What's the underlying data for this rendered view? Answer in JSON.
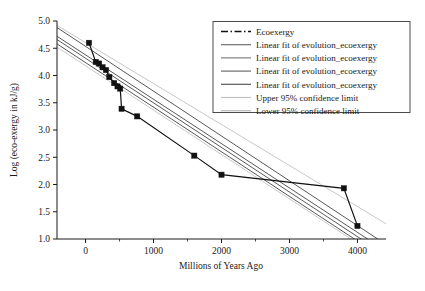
{
  "chart_data": {
    "type": "line",
    "title": "",
    "xlabel": "Millions of Years Ago",
    "ylabel": "Log (eco-exergy in kJ/g)",
    "xlim": [
      -420,
      4420
    ],
    "ylim": [
      1.0,
      5.0
    ],
    "grid": false,
    "legend_position": "top-right",
    "x_major_ticks": [
      0,
      1000,
      2000,
      3000,
      4000
    ],
    "x_tick_labels": [
      "0",
      "1000",
      "2000",
      "3000",
      "4000"
    ],
    "x_minor_ticks": [
      500,
      1500,
      2500,
      3500
    ],
    "y_major_ticks": [
      1.0,
      1.5,
      2.0,
      2.5,
      3.0,
      3.5,
      4.0,
      4.5,
      5.0
    ],
    "y_tick_labels": [
      "1.0",
      "1.5",
      "2.0",
      "2.5",
      "3.0",
      "3.5",
      "4.0",
      "4.5",
      "5.0"
    ],
    "series": [
      {
        "name": "Ecoexergy",
        "style": "dash-dot-marker",
        "color": "#111111",
        "x": [
          50,
          150,
          200,
          250,
          300,
          350,
          420,
          470,
          510,
          530,
          760,
          1600,
          2000,
          3800,
          4000
        ],
        "y": [
          4.6,
          4.25,
          4.22,
          4.15,
          4.1,
          3.97,
          3.86,
          3.8,
          3.76,
          3.39,
          3.25,
          2.53,
          2.18,
          1.93,
          1.24
        ]
      },
      {
        "name": "Linear fit of evolution_ecoexergy",
        "style": "solid",
        "color": "#595959",
        "x": [
          -420,
          4420
        ],
        "y": [
          4.88,
          0.9
        ]
      },
      {
        "name": "Linear fit of evolution_ecoexergy",
        "style": "solid",
        "color": "#595959",
        "x": [
          -420,
          4420
        ],
        "y": [
          4.72,
          0.78
        ]
      },
      {
        "name": "Linear fit of evolution_ecoexergy",
        "style": "solid",
        "color": "#595959",
        "x": [
          -420,
          4420
        ],
        "y": [
          4.66,
          0.7
        ]
      },
      {
        "name": "Linear fit of evolution_ecoexergy",
        "style": "solid",
        "color": "#595959",
        "x": [
          -420,
          4420
        ],
        "y": [
          4.58,
          0.62
        ]
      },
      {
        "name": "Upper 95% confidence limit",
        "style": "solid",
        "color": "#c8c8c8",
        "x": [
          -420,
          4420
        ],
        "y": [
          4.92,
          1.28
        ]
      },
      {
        "name": "Lower 95% confidence limit",
        "style": "solid",
        "color": "#c8c8c8",
        "x": [
          -420,
          4420
        ],
        "y": [
          4.52,
          0.58
        ]
      }
    ],
    "legend_entries": [
      {
        "label": "Ecoexergy",
        "style": "dash-dot-marker",
        "color": "#111111"
      },
      {
        "label": "Linear fit of evolution_ecoexergy",
        "style": "solid",
        "color": "#6e6e6e"
      },
      {
        "label": "Linear fit of evolution_ecoexergy",
        "style": "solid",
        "color": "#808080"
      },
      {
        "label": "Linear fit of evolution_ecoexergy",
        "style": "solid",
        "color": "#6e6e6e"
      },
      {
        "label": "Linear fit of evolution_ecoexergy",
        "style": "solid",
        "color": "#5a5a5a"
      },
      {
        "label": "Upper 95% confidence limit",
        "style": "solid",
        "color": "#c0c0c0"
      },
      {
        "label": "Lower 95% confidence limit",
        "style": "solid",
        "color": "#b8b8b8"
      }
    ]
  }
}
